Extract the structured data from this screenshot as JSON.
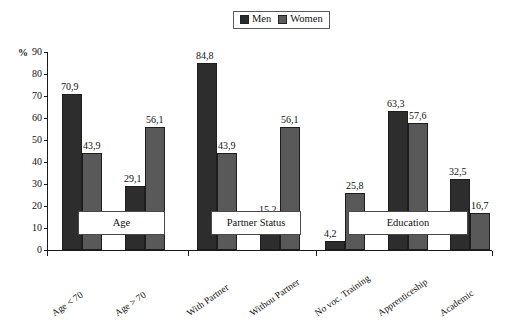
{
  "legend": {
    "men_label": "Men",
    "women_label": "Women",
    "men_color": "#2d2d2d",
    "women_color": "#595959"
  },
  "axis": {
    "unit_label": "%",
    "y_ticks": [
      "90",
      "80",
      "70",
      "60",
      "50",
      "40",
      "30",
      "20",
      "10",
      "0"
    ]
  },
  "group_boxes": [
    {
      "label": "Age"
    },
    {
      "label": "Partner Status"
    },
    {
      "label": "Education"
    }
  ],
  "chart_data": {
    "type": "bar",
    "title": "",
    "xlabel": "",
    "ylabel": "%",
    "ylim": [
      0,
      90
    ],
    "grid": false,
    "legend_position": "top-center",
    "categories": [
      "Age < 70",
      "Age > 70",
      "With Partner",
      "Withou Partner",
      "No voc. Training",
      "Apprenticeship",
      "Academic"
    ],
    "groups": [
      {
        "name": "Age",
        "categories": [
          "Age < 70",
          "Age > 70"
        ]
      },
      {
        "name": "Partner Status",
        "categories": [
          "With Partner",
          "Withou Partner"
        ]
      },
      {
        "name": "Education",
        "categories": [
          "No voc. Training",
          "Apprenticeship",
          "Academic"
        ]
      }
    ],
    "series": [
      {
        "name": "Men",
        "color": "#2d2d2d",
        "values": [
          70.9,
          29.1,
          84.8,
          15.2,
          4.2,
          63.3,
          32.5
        ],
        "labels": [
          "70,9",
          "29,1",
          "84,8",
          "15,2",
          "4,2",
          "63,3",
          "32,5"
        ]
      },
      {
        "name": "Women",
        "color": "#595959",
        "values": [
          43.9,
          56.1,
          43.9,
          56.1,
          25.8,
          57.6,
          16.7
        ],
        "labels": [
          "43,9",
          "56,1",
          "43,9",
          "56,1",
          "25,8",
          "57,6",
          "16,7"
        ]
      }
    ]
  }
}
